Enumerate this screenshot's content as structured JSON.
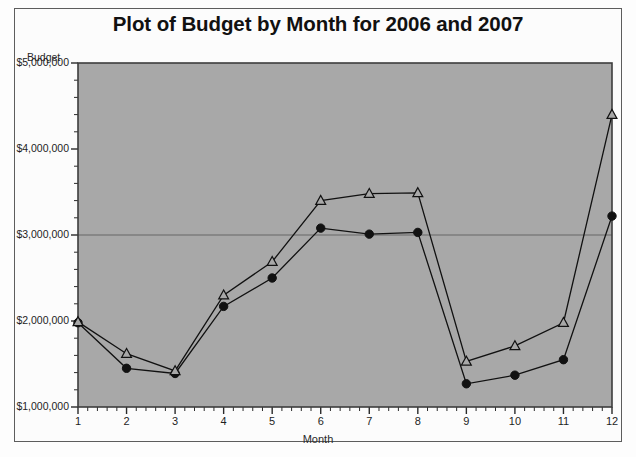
{
  "chart_data": {
    "type": "line",
    "title": "Plot of Budget by Month for 2006 and 2007",
    "xlabel": "Month",
    "ylabel": "Budget",
    "x": [
      1,
      2,
      3,
      4,
      5,
      6,
      7,
      8,
      9,
      10,
      11,
      12
    ],
    "xtick_labels": [
      "1",
      "2",
      "3",
      "4",
      "5",
      "6",
      "7",
      "8",
      "9",
      "10",
      "11",
      "12"
    ],
    "ytick_labels": [
      "$1,000,000",
      "$2,000,000",
      "$3,000,000",
      "$4,000,000",
      "$5,000,000"
    ],
    "ytick_values": [
      1000000,
      2000000,
      3000000,
      4000000,
      5000000
    ],
    "ylim": [
      1000000,
      5000000
    ],
    "xlim": [
      1,
      12
    ],
    "grid": "horizontal-line-at-3000000",
    "legend": "none",
    "series": [
      {
        "name": "2006",
        "marker": "filled-circle",
        "color": "#111111",
        "values": [
          1980000,
          1450000,
          1390000,
          2170000,
          2500000,
          3080000,
          3010000,
          3030000,
          1270000,
          1370000,
          1550000,
          3220000
        ]
      },
      {
        "name": "2007",
        "marker": "open-triangle",
        "color": "#111111",
        "values": [
          1990000,
          1620000,
          1420000,
          2300000,
          2690000,
          3400000,
          3480000,
          3490000,
          1530000,
          1710000,
          1980000,
          4400000
        ]
      }
    ]
  },
  "figure": {
    "plot_area_fill": "#a8a8a8",
    "plot_area_border": "#3c3c3c",
    "frame_border": "#5d5d5d",
    "background": "#fdfdfd"
  }
}
